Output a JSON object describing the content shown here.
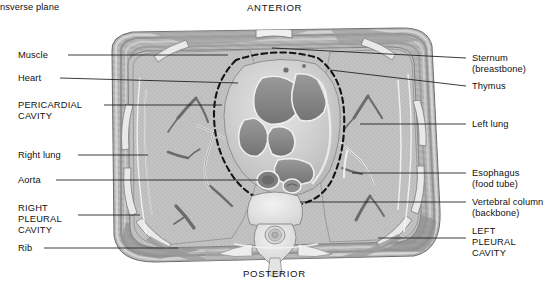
{
  "figure": {
    "plane_caption": "nsverse plane",
    "orientation": {
      "top": "ANTERIOR",
      "bottom": "POSTERIOR"
    }
  },
  "labels_left": [
    {
      "id": "muscle",
      "text": "Muscle",
      "x": 18,
      "y": 50,
      "lead": [
        [
          68,
          55
        ],
        [
          228,
          55
        ]
      ]
    },
    {
      "id": "heart",
      "text": "Heart",
      "x": 18,
      "y": 73,
      "lead": [
        [
          60,
          78
        ],
        [
          238,
          83
        ]
      ]
    },
    {
      "id": "pericardial-cavity",
      "text": "PERICARDIAL\nCAVITY",
      "x": 18,
      "y": 100,
      "lead": [
        [
          104,
          105
        ],
        [
          222,
          105
        ]
      ]
    },
    {
      "id": "right-lung",
      "text": "Right lung",
      "x": 18,
      "y": 150,
      "lead": [
        [
          78,
          155
        ],
        [
          148,
          155
        ]
      ]
    },
    {
      "id": "aorta",
      "text": "Aorta",
      "x": 18,
      "y": 175,
      "lead": [
        [
          56,
          180
        ],
        [
          258,
          180
        ]
      ]
    },
    {
      "id": "right-pleural-cavity",
      "text": "RIGHT\nPLEURAL\nCAVITY",
      "x": 18,
      "y": 203,
      "lead": [
        [
          78,
          215
        ],
        [
          140,
          215
        ]
      ]
    },
    {
      "id": "rib",
      "text": "Rib",
      "x": 18,
      "y": 243,
      "lead": [
        [
          44,
          248
        ],
        [
          178,
          248
        ]
      ]
    }
  ],
  "labels_right": [
    {
      "id": "sternum",
      "text": "Sternum\n(breastbone)",
      "x": 472,
      "y": 53,
      "lead": [
        [
          466,
          58
        ],
        [
          272,
          48
        ]
      ]
    },
    {
      "id": "thymus",
      "text": "Thymus",
      "x": 472,
      "y": 81,
      "lead": [
        [
          466,
          86
        ],
        [
          330,
          70
        ]
      ]
    },
    {
      "id": "left-lung",
      "text": "Left lung",
      "x": 472,
      "y": 119,
      "lead": [
        [
          466,
          124
        ],
        [
          360,
          124
        ]
      ]
    },
    {
      "id": "esophagus",
      "text": "Esophagus\n(food tube)",
      "x": 472,
      "y": 168,
      "lead": [
        [
          466,
          173
        ],
        [
          352,
          173
        ]
      ]
    },
    {
      "id": "vertebral-column",
      "text": "Vertebral column\n(backbone)",
      "x": 472,
      "y": 197,
      "lead": [
        [
          466,
          202
        ],
        [
          300,
          202
        ]
      ]
    },
    {
      "id": "left-pleural-cavity",
      "text": "LEFT\nPLEURAL\nCAVITY",
      "x": 472,
      "y": 226,
      "lead": [
        [
          466,
          238
        ],
        [
          378,
          238
        ]
      ]
    }
  ],
  "colors": {
    "ink": "#111111",
    "body_wall": "#a9a9a9",
    "lung_field": "#bdbdbd",
    "heart_muscle": "#c9c9c9",
    "blood_pool": "#8a8a8a",
    "bone": "#e8e8e8",
    "pericardium_dash": "#141414"
  }
}
